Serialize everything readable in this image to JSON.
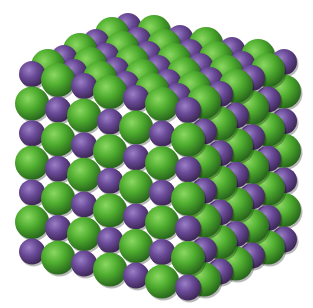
{
  "image": {
    "description": "Space-filling model of a sodium chloride crystal lattice",
    "alt": "Cubic ionic crystal lattice of alternating green and purple spheres",
    "background": "#ffffff"
  },
  "lattice": {
    "size": 7,
    "origin": [
      32,
      74
    ],
    "col_step": [
      26,
      6
    ],
    "row_step": [
      0,
      29.6
    ],
    "depth_step": [
      16,
      -8
    ],
    "ions": {
      "large": {
        "name": "chloride",
        "color": "#4fae2f",
        "light": "#8bd862",
        "dark": "#24601a",
        "radius": 17
      },
      "small": {
        "name": "sodium",
        "color": "#6a4a98",
        "light": "#9b7fc6",
        "dark": "#38234f",
        "radius": 13
      }
    },
    "small_when_parity_even": true
  }
}
